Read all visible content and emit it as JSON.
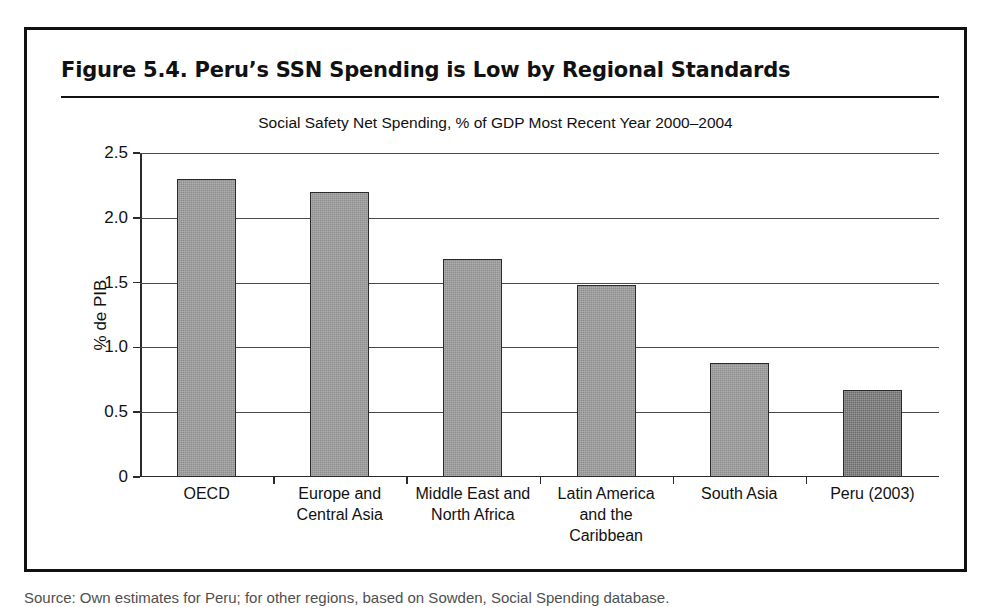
{
  "figure": {
    "title": "Figure 5.4.  Peru’s SSN Spending is Low by Regional Standards",
    "source_caption": "Source: Own estimates for Peru; for other regions, based on Sowden, Social Spending database."
  },
  "chart_data": {
    "type": "bar",
    "title": "Social Safety Net Spending, % of GDP Most Recent Year 2000–2004",
    "xlabel": "",
    "ylabel": "% de PIB",
    "ylim": [
      0,
      2.5
    ],
    "ytick_labels": [
      "0",
      "0.5",
      "1.0",
      "1.5",
      "2.0",
      "2.5"
    ],
    "ytick_values": [
      0,
      0.5,
      1.0,
      1.5,
      2.0,
      2.5
    ],
    "grid": true,
    "legend": "none",
    "categories": [
      "OECD",
      "Europe and Central Asia",
      "Middle East and North Africa",
      "Latin America and the Caribbean",
      "South Asia",
      "Peru (2003)"
    ],
    "category_lines": [
      [
        "OECD"
      ],
      [
        "Europe and",
        "Central Asia"
      ],
      [
        "Middle East and",
        "North Africa"
      ],
      [
        "Latin America",
        "and the",
        "Caribbean"
      ],
      [
        "South Asia"
      ],
      [
        "Peru (2003)"
      ]
    ],
    "values": [
      2.3,
      2.2,
      1.68,
      1.48,
      0.88,
      0.67
    ],
    "bar_colors": [
      "#8d8d8d",
      "#8d8d8d",
      "#8d8d8d",
      "#8d8d8d",
      "#8d8d8d",
      "#6b6b6b"
    ],
    "highlight_index": 5
  }
}
